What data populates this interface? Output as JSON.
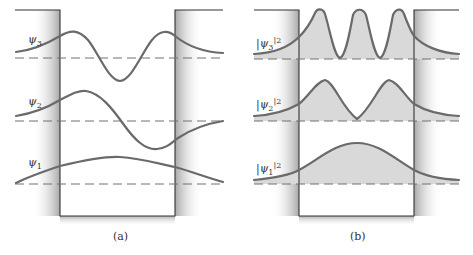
{
  "panels": [
    {
      "id": "a",
      "caption": "(a)",
      "curves": [
        {
          "label": "ψ",
          "sub": "3",
          "sup": ""
        },
        {
          "label": "ψ",
          "sub": "2",
          "sup": ""
        },
        {
          "label": "ψ",
          "sub": "1",
          "sup": ""
        }
      ]
    },
    {
      "id": "b",
      "caption": "(b)",
      "curves": [
        {
          "label": "|ψ",
          "sub": "3",
          "sup": "|2"
        },
        {
          "label": "|ψ",
          "sub": "2",
          "sup": "|2"
        },
        {
          "label": "|ψ",
          "sub": "1",
          "sup": "|2"
        }
      ]
    }
  ],
  "colors": {
    "curve": "#6a6a6a",
    "fill": "#d9d9d9",
    "wall": "#333333",
    "shade": "#bdbdbd"
  }
}
